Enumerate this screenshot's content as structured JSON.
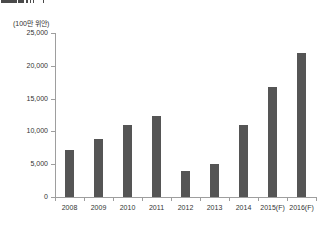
{
  "page": {
    "background": "#ffffff"
  },
  "clipped_title": {
    "note": "chart title cropped at top edge of screenshot, only bottom pixel fragments visible",
    "fragments": [
      {
        "x": 1,
        "w": 3.5
      },
      {
        "x": 5,
        "w": 3.5
      },
      {
        "x": 9,
        "w": 3.5
      },
      {
        "x": 13,
        "w": 3.5
      },
      {
        "x": 17.5,
        "w": 6
      },
      {
        "x": 26,
        "w": 1.5
      },
      {
        "x": 29.5,
        "w": 1.5
      },
      {
        "x": 33,
        "w": 1
      },
      {
        "x": 42.5,
        "w": 1.5
      }
    ]
  },
  "chart": {
    "unit_label": "(100만 위안)",
    "colors": {
      "bar": "#555555",
      "axis": "#9e9e9e",
      "text": "#333333",
      "fragment": "#4a4a4a"
    }
  },
  "chart_data": {
    "type": "bar",
    "categories": [
      "2008",
      "2009",
      "2010",
      "2011",
      "2012",
      "2013",
      "2014",
      "2015(F)",
      "2016(F)"
    ],
    "values": [
      7200,
      8900,
      11000,
      12400,
      4000,
      5100,
      11000,
      16800,
      21900
    ],
    "title": "",
    "xlabel": "",
    "ylabel": "(100만 위안)",
    "ylim": [
      0,
      25000
    ],
    "yticks": [
      0,
      5000,
      10000,
      15000,
      20000,
      25000
    ],
    "ytick_labels": [
      "0",
      "5,000",
      "10,000",
      "15,000",
      "20,000",
      "25,000"
    ],
    "grid": false,
    "legend": false
  }
}
